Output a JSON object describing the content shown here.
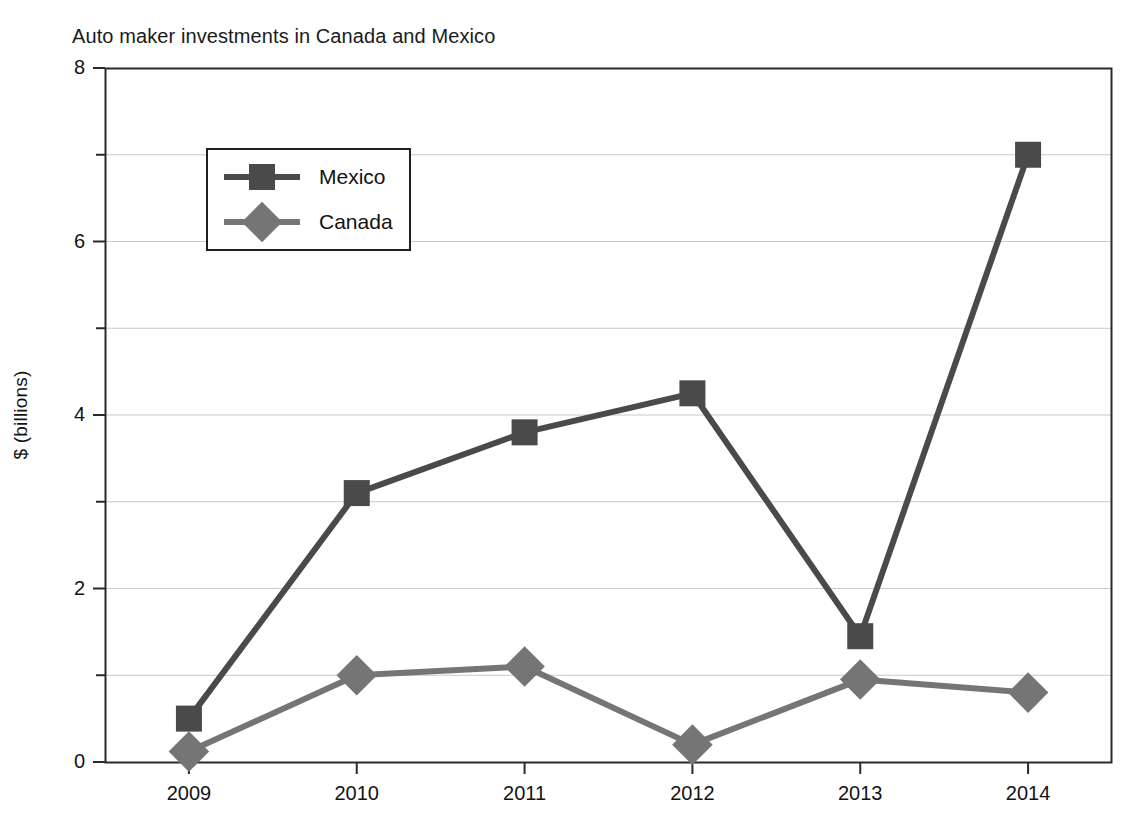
{
  "chart_data": {
    "type": "line",
    "title": "Auto maker investments in Canada and Mexico",
    "xlabel": "",
    "ylabel": "$ (billions)",
    "categories": [
      "2009",
      "2010",
      "2011",
      "2012",
      "2013",
      "2014"
    ],
    "series": [
      {
        "name": "Mexico",
        "marker": "square",
        "color": "#4a4a4a",
        "values": [
          0.5,
          3.1,
          3.8,
          4.25,
          1.45,
          7.0
        ]
      },
      {
        "name": "Canada",
        "marker": "diamond",
        "color": "#757575",
        "values": [
          0.12,
          1.0,
          1.1,
          0.2,
          0.95,
          0.8
        ]
      }
    ],
    "ylim": [
      0,
      8
    ],
    "y_ticks_major": [
      "0",
      "2",
      "4",
      "6",
      "8"
    ],
    "y_ticks_minor": [
      "1",
      "3",
      "5",
      "7"
    ],
    "grid": true,
    "grid_orientation": "horizontal",
    "legend_position": "upper-left-inside",
    "axis_color": "#2a2a2a",
    "grid_color": "#c9c9c9",
    "background": "#ffffff"
  }
}
